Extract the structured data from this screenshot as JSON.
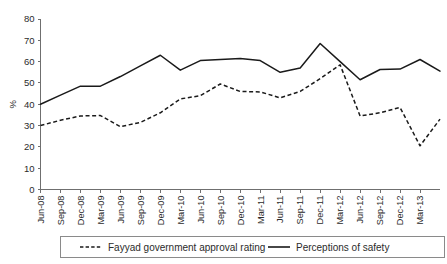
{
  "chart_data": {
    "type": "line",
    "title": "",
    "subtitle": "",
    "xlabel": "",
    "ylabel": "%",
    "ylim": [
      0,
      80
    ],
    "ytick_step": 10,
    "yticks": [
      "0",
      "10",
      "20",
      "30",
      "40",
      "50",
      "60",
      "70",
      "80"
    ],
    "grid": false,
    "legend_position": "bottom",
    "categories": [
      "Jun-08",
      "Sep-08",
      "Dec-08",
      "Mar-09",
      "Jun-09",
      "Sep-09",
      "Dec-09",
      "Mar-10",
      "Jun-10",
      "Sep-10",
      "Dec-10",
      "Mar-11",
      "Jun-11",
      "Sep-11",
      "Dec-11",
      "Mar-12",
      "Jun-12",
      "Sep-12",
      "Dec-12",
      "Mar-13",
      ""
    ],
    "series": [
      {
        "name": "Fayyad government approval rating",
        "style": "dashed",
        "color": "#1a1a1a",
        "values": [
          30,
          32.5,
          34.5,
          34.7,
          29.5,
          31.5,
          36,
          42.5,
          44,
          49.5,
          46,
          45.8,
          43,
          46,
          52,
          58.5,
          34.5,
          36,
          38.5,
          20.5,
          33
        ]
      },
      {
        "name": "Perceptions of safety",
        "style": "solid",
        "color": "#1a1a1a",
        "values": [
          40,
          44.3,
          48.5,
          48.5,
          53,
          58,
          63,
          56,
          60.5,
          61,
          61.5,
          60.5,
          55,
          57,
          68.5,
          60,
          51.5,
          56.3,
          56.5,
          61,
          55.5
        ]
      }
    ],
    "legend": [
      {
        "label": "Fayyad government approval rating",
        "style": "dashed"
      },
      {
        "label": "Perceptions of safety",
        "style": "solid"
      }
    ]
  }
}
